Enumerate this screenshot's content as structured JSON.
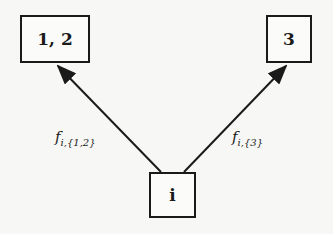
{
  "diagram": {
    "nodes": [
      {
        "id": "n12",
        "label": "1, 2"
      },
      {
        "id": "n3",
        "label": "3"
      },
      {
        "id": "ni",
        "label": "i"
      }
    ],
    "edges": [
      {
        "from": "i",
        "to": "1, 2",
        "label_main": "f",
        "label_sub": "i,{1,2}"
      },
      {
        "from": "i",
        "to": "3",
        "label_main": "f",
        "label_sub": "i,{3}"
      }
    ],
    "colors": {
      "stroke": "#1a1a1a",
      "background": "#f7f7f5"
    }
  }
}
